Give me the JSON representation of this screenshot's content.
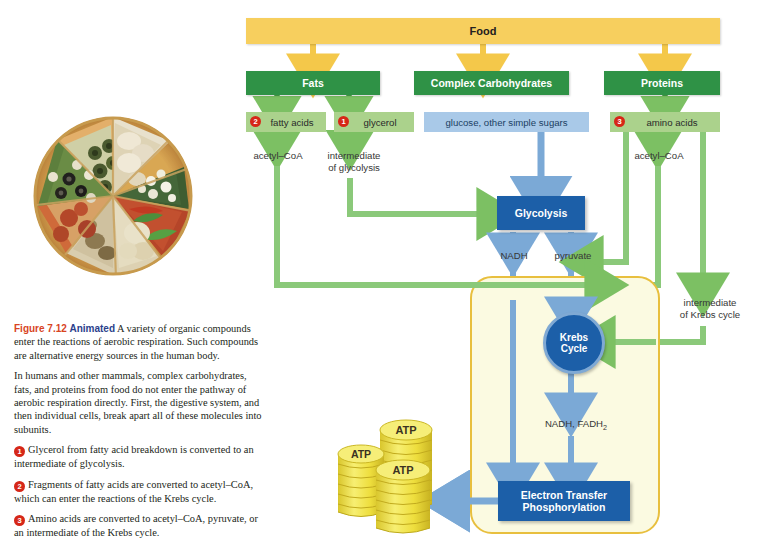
{
  "figure": {
    "number_label": "Figure 7.12",
    "animated_label": "Animated",
    "intro": "A variety of organic compounds enter the reactions of aerobic respiration. Such compounds are alternative energy sources in the human body.",
    "paragraph2": "In humans and other mammals, complex carbohydrates, fats, and proteins from food do not enter the pathway of aerobic respiration directly. First, the digestive system, and then individual cells, break apart all of these molecules into subunits.",
    "notes": [
      {
        "num": "1",
        "text": "Glycerol from fatty acid breakdown is converted to an intermediate of glycolysis."
      },
      {
        "num": "2",
        "text": "Fragments of fatty acids are converted to acetyl–CoA, which can enter the reactions of the Krebs cycle."
      },
      {
        "num": "3",
        "text": "Amino acids are converted to acetyl–CoA, pyruvate, or an intermediate of the Krebs cycle."
      }
    ]
  },
  "photo": {
    "name": "pizza-photograph",
    "alt": "Pizza with eight differently topped slices"
  },
  "diagram": {
    "food": "Food",
    "groups": [
      {
        "key": "fats",
        "label": "Fats"
      },
      {
        "key": "carbs",
        "label": "Complex Carbohydrates"
      },
      {
        "key": "proteins",
        "label": "Proteins"
      }
    ],
    "subunits": [
      {
        "key": "fatty-acids",
        "label": "fatty acids",
        "num": "2",
        "style": "green"
      },
      {
        "key": "glycerol",
        "label": "glycerol",
        "num": "1",
        "style": "green"
      },
      {
        "key": "sugars",
        "label": "glucose, other simple sugars",
        "num": "",
        "style": "blue"
      },
      {
        "key": "amino-acids",
        "label": "amino acids",
        "num": "3",
        "style": "green"
      }
    ],
    "intermediates": [
      {
        "key": "acetyl-coa-left",
        "text": "acetyl–CoA"
      },
      {
        "key": "intermediate-glycolysis",
        "text": "intermediate\nof glycolysis"
      },
      {
        "key": "acetyl-coa-right",
        "text": "acetyl–CoA"
      },
      {
        "key": "intermediate-krebs",
        "text": "intermediate\nof Krebs cycle"
      }
    ],
    "processes": {
      "glycolysis": "Glycolysis",
      "krebs_line1": "Krebs",
      "krebs_line2": "Cycle",
      "etp_line1": "Electron Transfer",
      "etp_line2": "Phosphorylation"
    },
    "products": {
      "nadh": "NADH",
      "pyruvate": "pyruvate",
      "nadh_fadh2": "NADH, FADH",
      "nadh_fadh2_sub": "2"
    },
    "atp_stacks": [
      {
        "key": "atp-stack-left",
        "label": "ATP"
      },
      {
        "key": "atp-stack-middle",
        "label": "ATP"
      },
      {
        "key": "atp-stack-right",
        "label": "ATP"
      }
    ]
  },
  "colors": {
    "food_yellow": "#f7cf5e",
    "group_green": "#2f9246",
    "subunit_green": "#abd28c",
    "subunit_blue": "#a9c9e8",
    "process_blue": "#1c5fa8",
    "arrow_green": "#7cc063",
    "arrow_blue": "#7ba9d6",
    "arrow_yellow": "#f4c84a",
    "mito_outline": "#e8bf3e",
    "mito_fill": "#fbfae1",
    "number_red": "#d62718",
    "figure_red": "#d8441f",
    "animated_blue": "#2b3f8c",
    "atp_gold": "#f2e14c"
  }
}
